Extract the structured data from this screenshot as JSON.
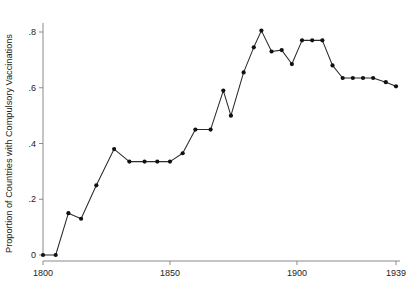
{
  "chart_data": {
    "type": "line",
    "title": "",
    "subtitle": "",
    "xlabel": "",
    "ylabel": "Proportion of Countries with Compulsory Vaccinations",
    "xlim": [
      1800,
      1939
    ],
    "ylim": [
      0,
      0.85
    ],
    "xticks": [
      1800,
      1850,
      1900,
      1939
    ],
    "xticklabels": [
      "1800",
      "1850",
      "1900",
      "1939"
    ],
    "yticks": [
      0,
      0.2,
      0.4,
      0.6,
      0.8
    ],
    "yticklabels": [
      "0",
      ".2",
      ".4",
      ".6",
      ".8"
    ],
    "grid": false,
    "legend": false,
    "legend_position": "none",
    "markers": "filled-circle",
    "marker_color": "#111111",
    "line_color": "#2b2b2b",
    "axis_color": "#8a8a8a",
    "series": [
      {
        "name": "Proportion of countries with compulsory vaccinations",
        "x": [
          1800,
          1805,
          1810,
          1815,
          1821,
          1828,
          1834,
          1840,
          1845,
          1850,
          1855,
          1860,
          1866,
          1871,
          1874,
          1879,
          1883,
          1886,
          1890,
          1894,
          1898,
          1902,
          1906,
          1910,
          1914,
          1918,
          1922,
          1926,
          1930,
          1935,
          1939
        ],
        "y": [
          0.0,
          0.0,
          0.15,
          0.13,
          0.25,
          0.38,
          0.335,
          0.335,
          0.335,
          0.335,
          0.365,
          0.45,
          0.45,
          0.59,
          0.5,
          0.655,
          0.745,
          0.805,
          0.73,
          0.735,
          0.685,
          0.77,
          0.77,
          0.77,
          0.68,
          0.635,
          0.635,
          0.635,
          0.635,
          0.62,
          0.605
        ]
      }
    ]
  }
}
